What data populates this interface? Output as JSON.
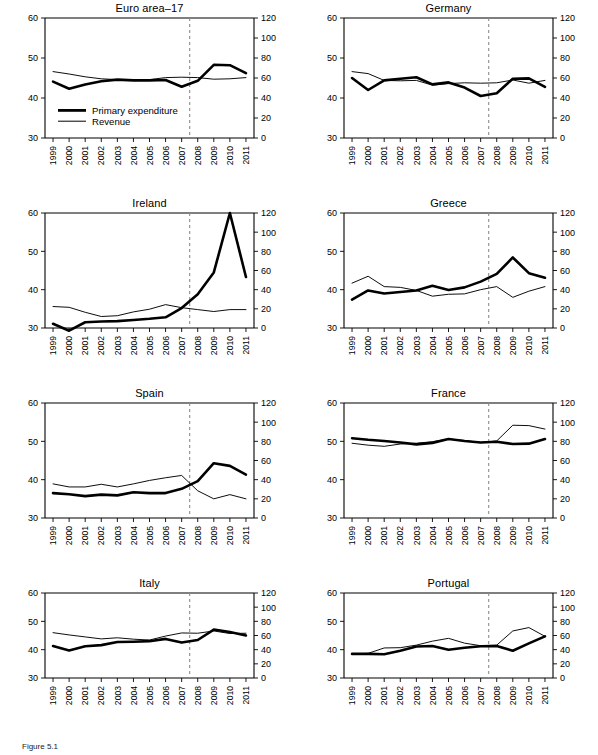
{
  "figure": {
    "caption": "Figure 5.1",
    "legend": {
      "expenditure_label": "Primary expenditure",
      "revenue_label": "Revenue"
    },
    "axes": {
      "left_ticks": [
        30,
        40,
        50,
        60
      ],
      "right_ticks": [
        0,
        20,
        40,
        60,
        80,
        100,
        120
      ],
      "left_range": [
        30,
        60
      ],
      "right_range": [
        0,
        120
      ],
      "years": [
        "1999",
        "2000",
        "2001",
        "2002",
        "2003",
        "2004",
        "2005",
        "2006",
        "2007",
        "2008",
        "2009",
        "2010",
        "2011"
      ],
      "crisis_marker_year": 2007.5
    }
  },
  "chart_data": [
    {
      "type": "line",
      "title": "Euro area–17",
      "xlabel": "",
      "ylabel": "",
      "x": [
        "1999",
        "2000",
        "2001",
        "2002",
        "2003",
        "2004",
        "2005",
        "2006",
        "2007",
        "2008",
        "2009",
        "2010",
        "2011"
      ],
      "ylim": [
        30,
        60
      ],
      "ylim_right": [
        0,
        120
      ],
      "grid": false,
      "legend_position": "inside-lower-left",
      "annotations": [
        "dashed vertical line at 2007/2008 boundary"
      ],
      "series": [
        {
          "name": "Primary expenditure",
          "axis": "left",
          "values": [
            44.1,
            42.3,
            43.4,
            44.2,
            44.6,
            44.4,
            44.4,
            44.5,
            42.8,
            44.3,
            48.3,
            48.2,
            46.2
          ]
        },
        {
          "name": "Revenue",
          "axis": "left",
          "values": [
            46.6,
            46.0,
            45.3,
            44.8,
            44.6,
            44.5,
            44.6,
            45.1,
            45.2,
            45.1,
            44.7,
            44.8,
            45.1
          ]
        }
      ]
    },
    {
      "type": "line",
      "title": "Germany",
      "xlabel": "",
      "ylabel": "",
      "x": [
        "1999",
        "2000",
        "2001",
        "2002",
        "2003",
        "2004",
        "2005",
        "2006",
        "2007",
        "2008",
        "2009",
        "2010",
        "2011"
      ],
      "ylim": [
        30,
        60
      ],
      "ylim_right": [
        0,
        120
      ],
      "grid": false,
      "legend_position": "none",
      "annotations": [
        "dashed vertical line at 2007/2008 boundary"
      ],
      "series": [
        {
          "name": "Primary expenditure",
          "axis": "left",
          "values": [
            45.0,
            42.0,
            44.4,
            44.8,
            45.2,
            43.4,
            43.9,
            42.6,
            40.5,
            41.2,
            44.8,
            44.9,
            42.8
          ]
        },
        {
          "name": "Revenue",
          "axis": "left",
          "values": [
            46.6,
            46.1,
            44.4,
            44.3,
            44.4,
            43.2,
            43.6,
            43.8,
            43.7,
            43.8,
            44.5,
            43.7,
            44.4
          ]
        }
      ]
    },
    {
      "type": "line",
      "title": "Ireland",
      "xlabel": "",
      "ylabel": "",
      "x": [
        "1999",
        "2000",
        "2001",
        "2002",
        "2003",
        "2004",
        "2005",
        "2006",
        "2007",
        "2008",
        "2009",
        "2010",
        "2011"
      ],
      "ylim": [
        30,
        60
      ],
      "ylim_right": [
        0,
        120
      ],
      "grid": false,
      "legend_position": "none",
      "annotations": [
        "dashed vertical line at 2007/2008 boundary",
        "spike to 60 in 2010"
      ],
      "series": [
        {
          "name": "Primary expenditure",
          "axis": "left",
          "values": [
            31.1,
            29.3,
            31.5,
            31.7,
            31.8,
            32.1,
            32.4,
            32.8,
            35.2,
            38.8,
            44.5,
            60.0,
            43.3
          ]
        },
        {
          "name": "Revenue",
          "axis": "left",
          "values": [
            35.6,
            35.4,
            34.1,
            33.0,
            33.2,
            34.2,
            34.9,
            36.1,
            35.3,
            34.8,
            34.3,
            34.8,
            34.8
          ]
        }
      ]
    },
    {
      "type": "line",
      "title": "Greece",
      "xlabel": "",
      "ylabel": "",
      "x": [
        "1999",
        "2000",
        "2001",
        "2002",
        "2003",
        "2004",
        "2005",
        "2006",
        "2007",
        "2008",
        "2009",
        "2010",
        "2011"
      ],
      "ylim": [
        30,
        60
      ],
      "ylim_right": [
        0,
        120
      ],
      "grid": false,
      "legend_position": "none",
      "annotations": [
        "dashed vertical line at 2007/2008 boundary"
      ],
      "series": [
        {
          "name": "Primary expenditure",
          "axis": "left",
          "values": [
            37.4,
            39.8,
            39.0,
            39.4,
            39.8,
            41.0,
            39.9,
            40.6,
            42.1,
            44.1,
            48.4,
            44.3,
            43.1
          ]
        },
        {
          "name": "Revenue",
          "axis": "left",
          "values": [
            41.7,
            43.5,
            40.8,
            40.6,
            39.8,
            38.3,
            38.8,
            38.9,
            40.0,
            40.8,
            38.0,
            39.6,
            40.8
          ]
        }
      ]
    },
    {
      "type": "line",
      "title": "Spain",
      "xlabel": "",
      "ylabel": "",
      "x": [
        "1999",
        "2000",
        "2001",
        "2002",
        "2003",
        "2004",
        "2005",
        "2006",
        "2007",
        "2008",
        "2009",
        "2010",
        "2011"
      ],
      "ylim": [
        30,
        60
      ],
      "ylim_right": [
        0,
        120
      ],
      "grid": false,
      "legend_position": "none",
      "annotations": [
        "dashed vertical line at 2007/2008 boundary"
      ],
      "series": [
        {
          "name": "Primary expenditure",
          "axis": "left",
          "values": [
            36.5,
            36.2,
            35.7,
            36.1,
            35.9,
            36.7,
            36.5,
            36.5,
            37.6,
            39.6,
            44.3,
            43.6,
            41.3
          ]
        },
        {
          "name": "Revenue",
          "axis": "left",
          "values": [
            38.9,
            38.1,
            38.1,
            38.8,
            38.1,
            38.9,
            39.8,
            40.5,
            41.1,
            37.1,
            35.0,
            36.1,
            35.0
          ]
        }
      ]
    },
    {
      "type": "line",
      "title": "France",
      "xlabel": "",
      "ylabel": "",
      "x": [
        "1999",
        "2000",
        "2001",
        "2002",
        "2003",
        "2004",
        "2005",
        "2006",
        "2007",
        "2008",
        "2009",
        "2010",
        "2011"
      ],
      "ylim": [
        30,
        60
      ],
      "ylim_right": [
        0,
        120
      ],
      "grid": false,
      "legend_position": "none",
      "annotations": [
        "dashed vertical line at 2007/2008 boundary"
      ],
      "series": [
        {
          "name": "Primary expenditure",
          "axis": "left",
          "values": [
            50.8,
            50.4,
            50.1,
            49.7,
            49.2,
            49.6,
            50.6,
            50.1,
            49.7,
            49.9,
            49.3,
            49.4,
            50.6
          ]
        },
        {
          "name": "Revenue",
          "axis": "left",
          "values": [
            49.5,
            49.0,
            48.7,
            49.3,
            49.5,
            49.9,
            50.6,
            50.2,
            49.7,
            50.1,
            54.2,
            54.1,
            53.2
          ]
        }
      ]
    },
    {
      "type": "line",
      "title": "Italy",
      "xlabel": "",
      "ylabel": "",
      "x": [
        "1999",
        "2000",
        "2001",
        "2002",
        "2003",
        "2004",
        "2005",
        "2006",
        "2007",
        "2008",
        "2009",
        "2010",
        "2011"
      ],
      "ylim": [
        30,
        60
      ],
      "ylim_right": [
        0,
        120
      ],
      "grid": false,
      "legend_position": "none",
      "annotations": [
        "dashed vertical line at 2007/2008 boundary"
      ],
      "series": [
        {
          "name": "Primary expenditure",
          "axis": "left",
          "values": [
            41.3,
            39.7,
            41.2,
            41.6,
            42.7,
            42.8,
            43.0,
            43.8,
            42.5,
            43.4,
            47.1,
            46.2,
            45.0
          ]
        },
        {
          "name": "Revenue",
          "axis": "left",
          "values": [
            46.0,
            45.2,
            44.5,
            43.8,
            44.2,
            43.7,
            43.4,
            44.8,
            45.9,
            45.8,
            46.6,
            45.7,
            45.8
          ]
        }
      ]
    },
    {
      "type": "line",
      "title": "Portugal",
      "xlabel": "",
      "ylabel": "",
      "x": [
        "1999",
        "2000",
        "2001",
        "2002",
        "2003",
        "2004",
        "2005",
        "2006",
        "2007",
        "2008",
        "2009",
        "2010",
        "2011"
      ],
      "ylim": [
        30,
        60
      ],
      "ylim_right": [
        0,
        120
      ],
      "grid": false,
      "legend_position": "none",
      "annotations": [
        "dashed vertical line at 2007/2008 boundary"
      ],
      "series": [
        {
          "name": "Primary expenditure",
          "axis": "left",
          "values": [
            38.5,
            38.5,
            38.4,
            39.6,
            41.1,
            41.3,
            40.0,
            40.7,
            41.2,
            41.3,
            39.6,
            42.2,
            44.7
          ]
        },
        {
          "name": "Revenue",
          "axis": "left",
          "values": [
            38.5,
            38.7,
            40.6,
            40.7,
            41.6,
            43.0,
            44.0,
            42.3,
            41.4,
            41.6,
            46.6,
            47.8,
            44.7
          ]
        }
      ]
    }
  ]
}
